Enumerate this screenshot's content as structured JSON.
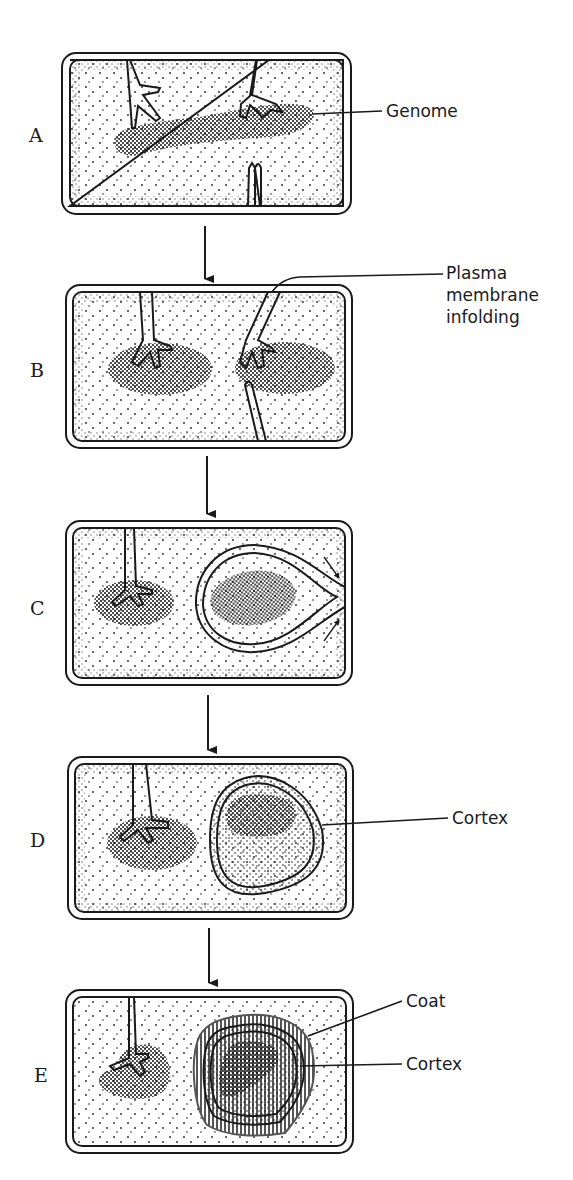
{
  "figure": {
    "stages": [
      {
        "letter": "A",
        "callouts": [
          {
            "lines": [
              "Genome"
            ]
          }
        ]
      },
      {
        "letter": "B",
        "callouts": [
          {
            "lines": [
              "Plasma",
              "membrane",
              "infolding"
            ]
          }
        ]
      },
      {
        "letter": "C",
        "callouts": []
      },
      {
        "letter": "D",
        "callouts": [
          {
            "lines": [
              "Cortex"
            ]
          }
        ]
      },
      {
        "letter": "E",
        "callouts": [
          {
            "lines": [
              "Coat"
            ]
          },
          {
            "lines": [
              "Cortex"
            ]
          }
        ]
      }
    ],
    "colors": {
      "ink": "#1a1a1a",
      "background": "#ffffff",
      "coat_fill": "#9a9a9a"
    }
  }
}
